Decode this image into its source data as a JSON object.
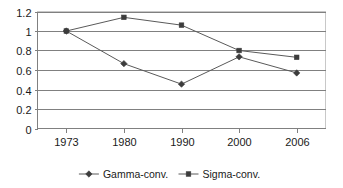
{
  "chart_data": {
    "type": "line",
    "title": "",
    "subtitle": "",
    "xlabel": "",
    "ylabel": "",
    "categories": [
      "1973",
      "1980",
      "1990",
      "2000",
      "2006"
    ],
    "series": [
      {
        "name": "Gamma-conv.",
        "marker": "diamond",
        "values": [
          1.0,
          0.665,
          0.455,
          0.735,
          0.57
        ]
      },
      {
        "name": "Sigma-conv.",
        "marker": "square",
        "values": [
          1.0,
          1.14,
          1.06,
          0.8,
          0.73
        ]
      }
    ],
    "ylim": [
      0,
      1.2
    ],
    "y_ticks": [
      0,
      0.2,
      0.4,
      0.6,
      0.8,
      1,
      1.2
    ],
    "y_tick_labels": [
      "0",
      "0.2",
      "0.4",
      "0.6",
      "0.8",
      "1",
      "1.2"
    ],
    "grid": "horizontal",
    "legend_position": "bottom",
    "colors": {
      "gridline": "#808080",
      "axis": "#808080",
      "series_line": "#5a5a5a",
      "marker": "#3c3c3c",
      "plot_border": "#c8c8c8",
      "background": "#ffffff",
      "text": "#1a1a1a"
    }
  },
  "legend": {
    "items": [
      {
        "label": "Gamma-conv.",
        "marker": "diamond"
      },
      {
        "label": "Sigma-conv.",
        "marker": "square"
      }
    ]
  }
}
